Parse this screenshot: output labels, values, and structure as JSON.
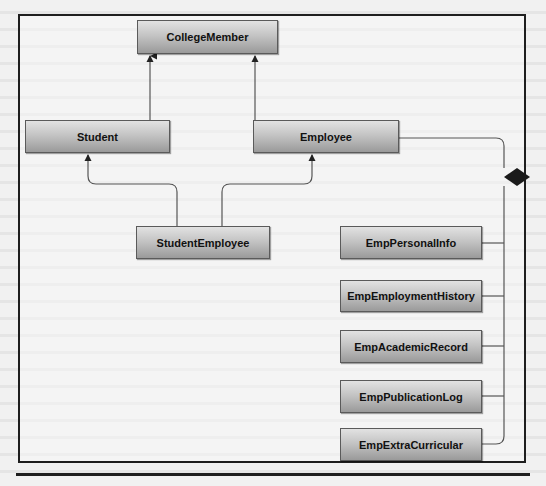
{
  "diagram": {
    "type": "UML class diagram",
    "classes": {
      "college_member": "CollegeMember",
      "student": "Student",
      "employee": "Employee",
      "student_employee": "StudentEmployee",
      "emp_personal_info": "EmpPersonalInfo",
      "emp_employment_history": "EmpEmploymentHistory",
      "emp_academic_record": "EmpAcademicRecord",
      "emp_publication_log": "EmpPublicationLog",
      "emp_extra_curricular": "EmpExtraCurricular"
    },
    "relationships": [
      {
        "type": "generalization",
        "from": "Student",
        "to": "CollegeMember"
      },
      {
        "type": "generalization",
        "from": "Employee",
        "to": "CollegeMember"
      },
      {
        "type": "generalization",
        "from": "StudentEmployee",
        "to": "Student"
      },
      {
        "type": "generalization",
        "from": "StudentEmployee",
        "to": "Employee"
      },
      {
        "type": "composition",
        "whole": "Employee",
        "parts": [
          "EmpPersonalInfo",
          "EmpEmploymentHistory",
          "EmpAcademicRecord",
          "EmpPublicationLog",
          "EmpExtraCurricular"
        ]
      }
    ],
    "colors": {
      "box_top": "#e2e2e2",
      "box_bottom": "#9a9a9a",
      "border": "#5a5a5a",
      "line": "#555555",
      "frame": "#1e1e1e",
      "diamond": "#1a1a1a"
    }
  }
}
